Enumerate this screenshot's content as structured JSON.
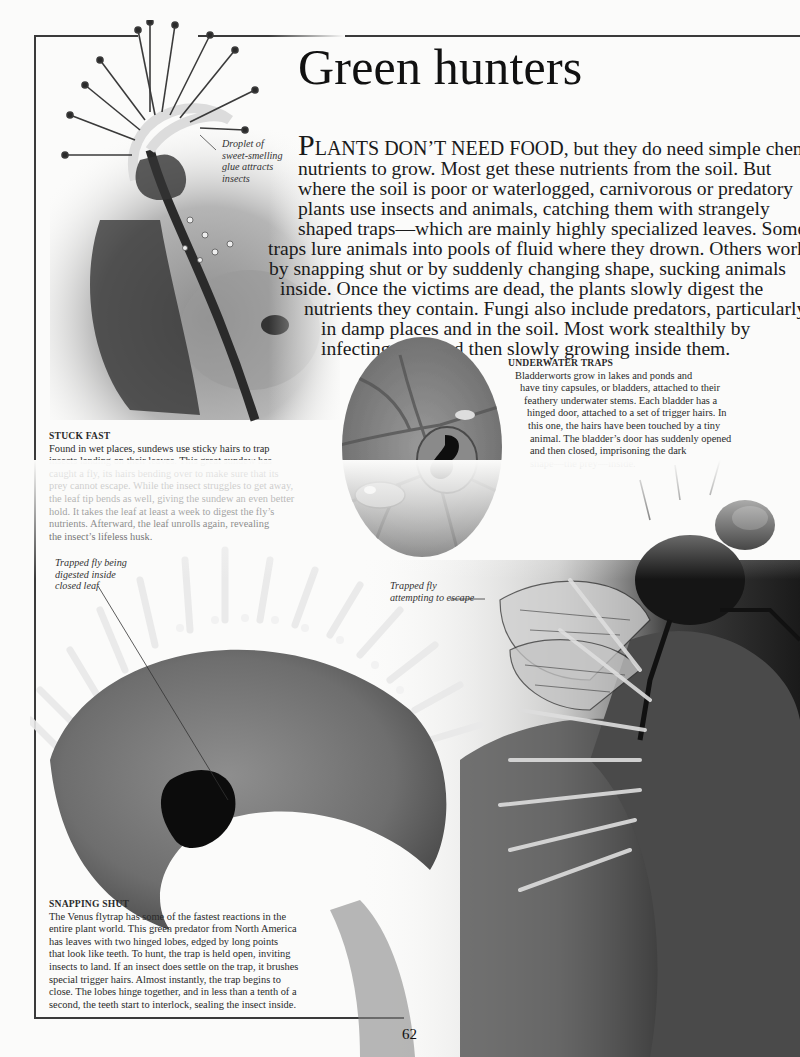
{
  "page": {
    "title": "Green hunters",
    "page_number": "62"
  },
  "intro": {
    "dropcap": "P",
    "smallcaps": "LANTS DON’T NEED FOOD",
    "lines": [
      ", but they do need simple chemical",
      "nutrients to grow. Most get these nutrients from the soil. But",
      "where the soil is poor or waterlogged, carnivorous or predatory",
      "plants use insects and animals, catching them with strangely",
      "shaped traps—which are mainly highly specialized leaves. Some",
      "traps lure animals into pools of fluid where they drown. Others work",
      "by snapping shut or by suddenly changing shape, sucking animals",
      "inside. Once the victims are dead, the plants slowly digest the",
      "nutrients they contain. Fungi also include predators, particularly",
      "in damp places and in the soil. Most work stealthily by",
      "infecting prey and then slowly growing inside them."
    ]
  },
  "labels": {
    "droplet": [
      "Droplet of",
      "sweet-smelling",
      "glue attracts",
      "insects"
    ],
    "trapped_digested": [
      "Trapped fly being",
      "digested inside",
      "closed leaf"
    ],
    "trapped_escape": [
      "Trapped fly",
      "attempting to escape"
    ]
  },
  "captions": {
    "stuck_fast": {
      "heading": "STUCK FAST",
      "lines": [
        "Found in wet places, sundews use sticky hairs to trap",
        "insects landing on their leaves. This great sundew has",
        "caught a fly, its hairs bending over to make sure that its",
        "prey cannot escape. While the insect struggles to get away,",
        "the leaf tip bends as well, giving the sundew an even better",
        "hold. It takes the leaf at least a week to digest the fly’s",
        "nutrients. Afterward, the leaf unrolls again, revealing",
        "the insect’s lifeless husk."
      ]
    },
    "underwater_traps": {
      "heading": "UNDERWATER TRAPS",
      "lines": [
        "Bladderworts grow in lakes and ponds and",
        "have tiny capsules, or bladders, attached to their",
        "feathery underwater stems. Each bladder has a",
        "hinged door, attached to a set of trigger hairs. In",
        "this one, the hairs have been touched by a tiny",
        "animal. The bladder’s door has suddenly opened",
        "and then closed, imprisoning the dark",
        "shape—the prey—inside."
      ]
    },
    "snapping_shut": {
      "heading": "SNAPPING SHUT",
      "lines": [
        "The Venus flytrap has some of the fastest reactions in the",
        "entire plant world. This green predator from North America",
        "has leaves with two hinged lobes, edged by long points",
        "that look like teeth. To hunt, the trap is held open, inviting",
        "insects to land. If an insect does settle on the trap, it brushes",
        "special trigger hairs. Almost instantly, the trap begins to",
        "close. The lobes hinge together, and in less than a tenth of a",
        "second, the teeth start to interlock, sealing the insect inside."
      ]
    }
  },
  "images": {
    "sundew": "sundew-photo",
    "bladderwort": "bladderwort-photo",
    "flytrap": "venus-flytrap-photo",
    "fly": "fly-photo"
  }
}
